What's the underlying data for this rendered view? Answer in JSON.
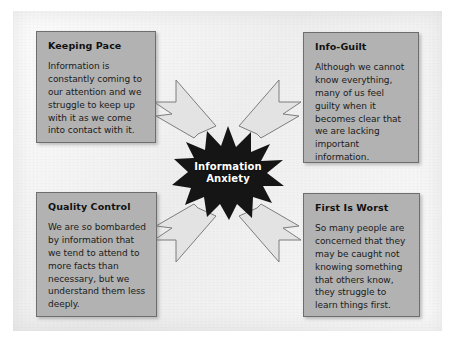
{
  "figure": {
    "center": {
      "label_line1": "Information",
      "label_line2": "Anxiety",
      "shape": "starburst",
      "fill_color": "#151515",
      "text_color": "#ffffff"
    },
    "panel_color": "#efefef",
    "box_color": "#b2b2b2",
    "box_border_color": "#6e6e6e",
    "arrow_fill_color": "#e3e3e3",
    "arrow_stroke_color": "#7d7d7d",
    "boxes": [
      {
        "id": "keeping-pace",
        "title": "Keeping Pace",
        "body": "Information is constantly coming to our attention and we struggle to keep up with it as we come into contact with it.",
        "position": "top-left"
      },
      {
        "id": "info-guilt",
        "title": "Info-Guilt",
        "body": "Although we cannot know everything, many of us feel guilty when it becomes clear that we are lacking important information.",
        "position": "top-right"
      },
      {
        "id": "quality-control",
        "title": "Quality Control",
        "body": "We are so bombarded by information that we tend to attend to more facts than necessary, but we understand them less deeply.",
        "position": "bottom-left"
      },
      {
        "id": "first-is-worst",
        "title": "First Is Worst",
        "body": "So many people are concerned that they may be caught not knowing something that others know, they struggle to learn things first.",
        "position": "bottom-right"
      }
    ],
    "arrows": [
      {
        "id": "arrow-top-left-to-center",
        "from": "keeping-pace",
        "to": "center",
        "direction": "down-right"
      },
      {
        "id": "arrow-top-right-to-center",
        "from": "info-guilt",
        "to": "center",
        "direction": "down-left"
      },
      {
        "id": "arrow-bottom-left-to-center",
        "from": "quality-control",
        "to": "center",
        "direction": "up-right"
      },
      {
        "id": "arrow-bottom-right-to-center",
        "from": "first-is-worst",
        "to": "center",
        "direction": "up-left"
      }
    ]
  }
}
